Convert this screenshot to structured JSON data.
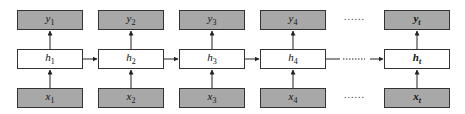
{
  "diagram": {
    "type": "unrolled-rnn",
    "columns": [
      {
        "x": {
          "var": "x",
          "sub": "1"
        },
        "h": {
          "var": "h",
          "sub": "1"
        },
        "y": {
          "var": "y",
          "sub": "1"
        },
        "left": 17
      },
      {
        "x": {
          "var": "x",
          "sub": "2"
        },
        "h": {
          "var": "h",
          "sub": "2"
        },
        "y": {
          "var": "y",
          "sub": "2"
        },
        "left": 98
      },
      {
        "x": {
          "var": "x",
          "sub": "3"
        },
        "h": {
          "var": "h",
          "sub": "3"
        },
        "y": {
          "var": "y",
          "sub": "3"
        },
        "left": 179
      },
      {
        "x": {
          "var": "x",
          "sub": "4"
        },
        "h": {
          "var": "h",
          "sub": "4"
        },
        "y": {
          "var": "y",
          "sub": "4"
        },
        "left": 260
      },
      {
        "x": {
          "var": "x",
          "sub": "t"
        },
        "h": {
          "var": "h",
          "sub": "t"
        },
        "y": {
          "var": "y",
          "sub": "t"
        },
        "left": 384
      }
    ],
    "ellipsis": "......",
    "colors": {
      "input_output_fill": "#a8a8a8",
      "hidden_fill": "#ffffff",
      "stroke": "#333333"
    }
  }
}
